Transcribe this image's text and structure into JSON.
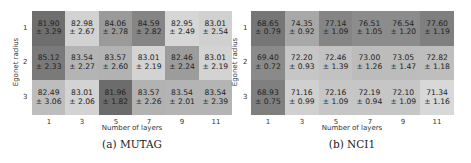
{
  "chart_data": [
    {
      "type": "heatmap",
      "title": "",
      "caption": "(a) MUTAG",
      "xlabel": "Number of layers",
      "ylabel": "Egonet radius",
      "x": [
        "1",
        "3",
        "5",
        "7",
        "9",
        "11"
      ],
      "y": [
        "1",
        "2",
        "3"
      ],
      "means": [
        [
          81.9,
          82.98,
          84.06,
          84.59,
          82.95,
          83.01
        ],
        [
          85.12,
          83.54,
          83.57,
          83.01,
          82.46,
          83.01
        ],
        [
          82.49,
          83.01,
          81.96,
          83.57,
          83.54,
          83.54
        ]
      ],
      "stds": [
        [
          3.29,
          2.67,
          2.78,
          2.82,
          2.49,
          2.54
        ],
        [
          2.33,
          2.27,
          2.6,
          2.19,
          2.24,
          2.19
        ],
        [
          3.06,
          2.06,
          1.82,
          2.26,
          2.01,
          2.39
        ]
      ],
      "labels": [
        [
          "81.90\n± 3.29",
          "82.98\n± 2.67",
          "84.06\n± 2.78",
          "84.59\n± 2.82",
          "82.95\n± 2.49",
          "83.01\n± 2.54"
        ],
        [
          "85.12\n± 2.33",
          "83.54\n± 2.27",
          "83.57\n± 2.60",
          "83.01\n± 2.19",
          "82.46\n± 2.24",
          "83.01\n± 2.19"
        ],
        [
          "82.49\n± 3.06",
          "83.01\n± 2.06",
          "81.96\n± 1.82",
          "83.57\n± 2.26",
          "83.54\n± 2.01",
          "83.54\n± 2.39"
        ]
      ],
      "colors": [
        [
          "#6e6e6e",
          "#d2d2d2",
          "#9a9a9a",
          "#858585",
          "#d6d6d6",
          "#d0d0d0"
        ],
        [
          "#7a7a7a",
          "#b4b4b4",
          "#b2b2b2",
          "#d3d3d3",
          "#9c9c9c",
          "#d3d3d3"
        ],
        [
          "#bdbdbd",
          "#d3d3d3",
          "#6c6c6c",
          "#b2b2b2",
          "#b4b4b4",
          "#b4b4b4"
        ]
      ]
    },
    {
      "type": "heatmap",
      "title": "",
      "caption": "(b) NCI1",
      "xlabel": "Number of layers",
      "ylabel": "Egonet radius",
      "x": [
        "1",
        "3",
        "5",
        "7",
        "9",
        "11"
      ],
      "y": [
        "1",
        "2",
        "3"
      ],
      "means": [
        [
          68.65,
          74.35,
          77.14,
          76.51,
          76.54,
          77.6
        ],
        [
          69.4,
          72.2,
          72.46,
          73.0,
          73.05,
          72.82
        ],
        [
          68.93,
          71.16,
          72.16,
          72.19,
          72.1,
          71.34
        ]
      ],
      "stds": [
        [
          0.79,
          0.92,
          1.09,
          1.05,
          1.2,
          1.19
        ],
        [
          0.72,
          0.93,
          1.39,
          1.26,
          1.47,
          1.18
        ],
        [
          0.75,
          0.99,
          1.09,
          0.94,
          1.09,
          1.16
        ]
      ],
      "labels": [
        [
          "68.65\n± 0.79",
          "74.35\n± 0.92",
          "77.14\n± 1.09",
          "76.51\n± 1.05",
          "76.54\n± 1.20",
          "77.60\n± 1.19"
        ],
        [
          "69.40\n± 0.72",
          "72.20\n± 0.93",
          "72.46\n± 1.39",
          "73.00\n± 1.26",
          "73.05\n± 1.47",
          "72.82\n± 1.18"
        ],
        [
          "68.93\n± 0.75",
          "71.16\n± 0.99",
          "72.16\n± 1.09",
          "72.19\n± 0.94",
          "72.10\n± 1.09",
          "71.34\n± 1.16"
        ]
      ],
      "colors": [
        [
          "#767676",
          "#a8a8a8",
          "#858585",
          "#8c8c8c",
          "#8c8c8c",
          "#7f7f7f"
        ],
        [
          "#8a8a8a",
          "#c6c6c6",
          "#c2c2c2",
          "#bcbcbc",
          "#bcbcbc",
          "#bebebe"
        ],
        [
          "#7f7f7f",
          "#d0d0d0",
          "#c6c6c6",
          "#c6c6c6",
          "#c6c6c6",
          "#d8d8d8"
        ]
      ]
    }
  ]
}
